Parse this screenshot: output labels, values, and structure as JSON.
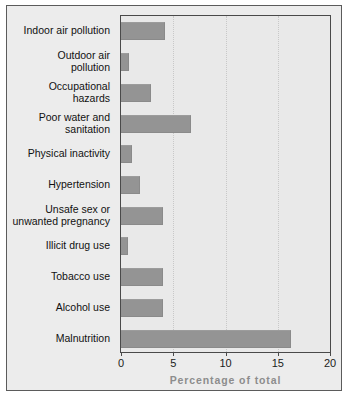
{
  "chart_data": {
    "type": "bar",
    "orientation": "horizontal",
    "title": "",
    "subtitle": "",
    "xlabel": "Percentage of total",
    "ylabel": "",
    "xlim": [
      0,
      20
    ],
    "xticks": [
      "0",
      "5",
      "10",
      "15",
      "20"
    ],
    "xtick_values": [
      0,
      5,
      10,
      15,
      20
    ],
    "grid": {
      "vertical": true,
      "horizontal": false,
      "style": "dotted",
      "at": [
        5,
        10,
        15
      ]
    },
    "legend": null,
    "categories": [
      "Indoor air pollution",
      "Outdoor air\npollution",
      "Occupational\nhazards",
      "Poor water and\nsanitation",
      "Physical inactivity",
      "Hypertension",
      "Unsafe sex or\nunwanted pregnancy",
      "Illicit drug use",
      "Tobacco use",
      "Alcohol use",
      "Malnutrition"
    ],
    "values": [
      4.2,
      0.8,
      2.9,
      6.7,
      1.1,
      1.8,
      4.0,
      0.7,
      4.0,
      4.0,
      16.3
    ],
    "colors": {
      "bar_fill": "#949494",
      "bar_edge": "#8a8a8a",
      "plot_background": "#e9e9e9",
      "figure_background": "#ececec",
      "page_background": "#ffffff",
      "gridline": "#c8c8c8",
      "axis_line": "#4a4a4a",
      "frame_border": "#5b5b5b",
      "label_text": "#111111",
      "axis_title_text": "#8d8d8d"
    }
  }
}
